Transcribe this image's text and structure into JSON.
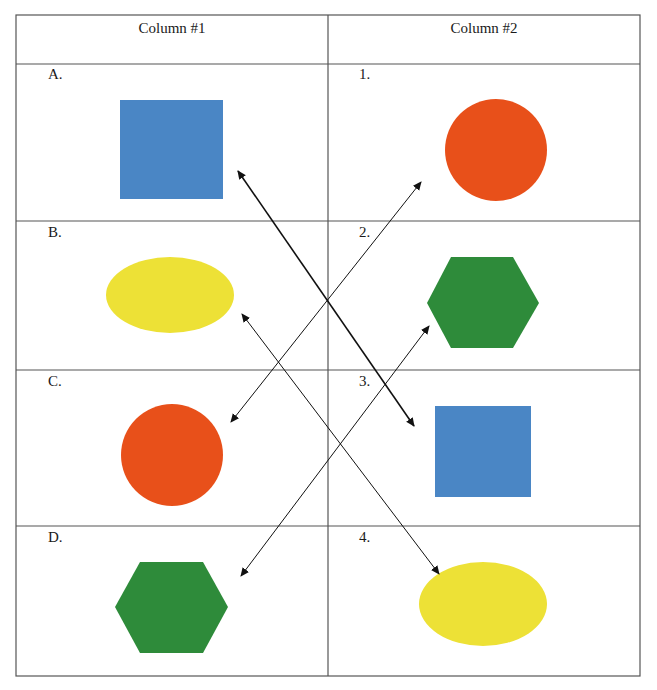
{
  "table": {
    "columns": [
      {
        "header": "Column #1"
      },
      {
        "header": "Column #2"
      }
    ],
    "column1_rows": [
      {
        "label": "A.",
        "shape": "square",
        "color": "#4a86c5"
      },
      {
        "label": "B.",
        "shape": "ellipse",
        "color": "#ede136"
      },
      {
        "label": "C.",
        "shape": "circle",
        "color": "#e8501a"
      },
      {
        "label": "D.",
        "shape": "hexagon",
        "color": "#2e8b3a"
      }
    ],
    "column2_rows": [
      {
        "label": "1.",
        "shape": "circle",
        "color": "#e8501a"
      },
      {
        "label": "2.",
        "shape": "hexagon",
        "color": "#2e8b3a"
      },
      {
        "label": "3.",
        "shape": "square",
        "color": "#4a86c5"
      },
      {
        "label": "4.",
        "shape": "ellipse",
        "color": "#ede136"
      }
    ]
  },
  "matches": [
    {
      "from": "A.",
      "to": "3.",
      "shape": "square",
      "arrowheads": "both"
    },
    {
      "from": "B.",
      "to": "4.",
      "shape": "ellipse",
      "arrowheads": "both"
    },
    {
      "from": "C.",
      "to": "1.",
      "shape": "circle",
      "arrowheads": "both"
    },
    {
      "from": "D.",
      "to": "2.",
      "shape": "hexagon",
      "arrowheads": "both"
    }
  ],
  "colors": {
    "blue": "#4a86c5",
    "yellow": "#ede136",
    "red": "#e8501a",
    "green": "#2e8b3a",
    "grid": "#555555",
    "arrow": "#111111"
  }
}
